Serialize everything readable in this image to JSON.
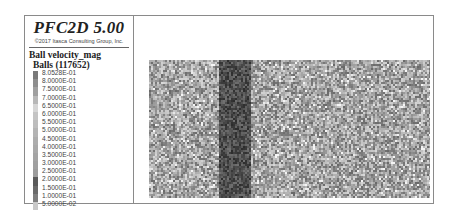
{
  "legend": {
    "app_title": "PFC2D 5.00",
    "copyright": "©2017 Itasca Consulting Group, Inc.",
    "variable": "Ball velocity_mag",
    "balls_label": "Balls (117652)",
    "ticks": [
      "8.0528E-01",
      "8.0000E-01",
      "7.5000E-01",
      "7.0000E-01",
      "6.5000E-01",
      "6.0000E-01",
      "5.5000E-01",
      "5.0000E-01",
      "4.5000E-01",
      "4.0000E-01",
      "3.5000E-01",
      "3.0000E-01",
      "2.5000E-01",
      "2.0000E-01",
      "1.5000E-01",
      "1.0000E-01",
      "5.0000E-02"
    ],
    "colors": [
      "#7a7a7a",
      "#8e8e8e",
      "#a0a0a0",
      "#b8b8b8",
      "#d6d6d6",
      "#c4c4c4",
      "#bdbdbd",
      "#b4b4b4",
      "#adadad",
      "#a9a9a9",
      "#a4a4a4",
      "#a0a0a0",
      "#9c9c9c",
      "#5a5a5a",
      "#6a6a6a",
      "#7e7e7e",
      "#c8c8c8"
    ]
  },
  "plot": {
    "background_gray": "#9a9a9a",
    "band_gray": "#4a4a4a"
  }
}
